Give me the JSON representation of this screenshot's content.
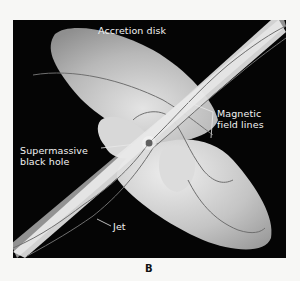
{
  "figure": {
    "panel_letter": "B",
    "labels": {
      "accretion_disk": "Accretion disk",
      "magnetic_field_lines_1": "Magnetic",
      "magnetic_field_lines_2": "field lines",
      "black_hole_1": "Supermassive",
      "black_hole_2": "black hole",
      "jet": "Jet"
    },
    "colors": {
      "background": "#050505",
      "disk": "#bdbdbd",
      "jet": "#e6e6e6",
      "field_line": "#6f6f6f",
      "label_text": "#f2f2f2"
    }
  }
}
